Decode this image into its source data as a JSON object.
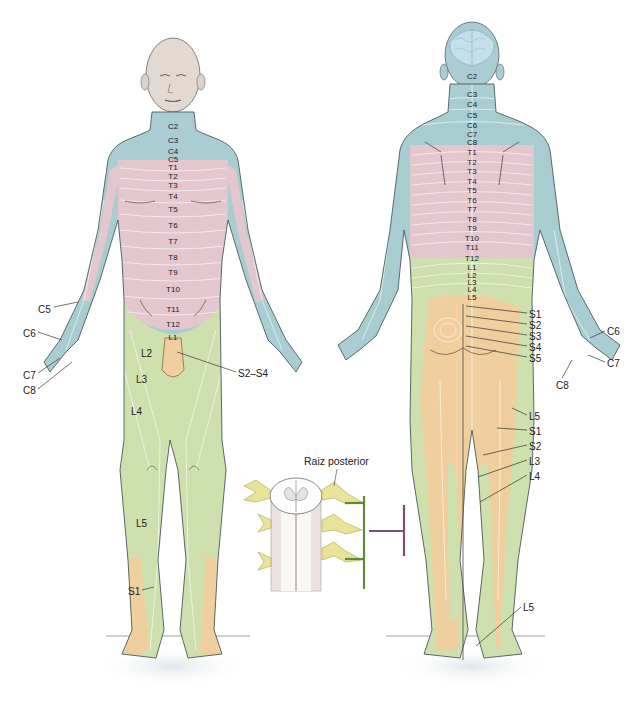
{
  "figure": {
    "colors": {
      "cervical": "#a9cdd2",
      "thoracic": "#e3c6ce",
      "lumbar": "#cfe0b0",
      "sacral": "#efcf9e",
      "skin": "#e6dfd8",
      "outline": "#4d5a5c",
      "nerve": "#e9e39a",
      "bracket_green": "#5e8a3a",
      "bracket_purple": "#7a4f73"
    }
  },
  "anterior": {
    "spine_labels": [
      {
        "text": "C2",
        "x": 173,
        "y": 123
      },
      {
        "text": "C3",
        "x": 173,
        "y": 137
      },
      {
        "text": "C4",
        "x": 173,
        "y": 148
      },
      {
        "text": "C5",
        "x": 173,
        "y": 156
      },
      {
        "text": "T1",
        "x": 173,
        "y": 164
      },
      {
        "text": "T2",
        "x": 173,
        "y": 173
      },
      {
        "text": "T3",
        "x": 173,
        "y": 182
      },
      {
        "text": "T4",
        "x": 173,
        "y": 193
      },
      {
        "text": "T5",
        "x": 173,
        "y": 206
      },
      {
        "text": "T6",
        "x": 173,
        "y": 222
      },
      {
        "text": "T7",
        "x": 173,
        "y": 238
      },
      {
        "text": "T8",
        "x": 173,
        "y": 254
      },
      {
        "text": "T9",
        "x": 173,
        "y": 269
      },
      {
        "text": "T10",
        "x": 173,
        "y": 286
      },
      {
        "text": "T11",
        "x": 173,
        "y": 306
      },
      {
        "text": "T12",
        "x": 173,
        "y": 321
      },
      {
        "text": "L1",
        "x": 173,
        "y": 334
      }
    ],
    "side_labels": [
      {
        "text": "C5",
        "x": 38,
        "y": 305
      },
      {
        "text": "C6",
        "x": 23,
        "y": 329
      },
      {
        "text": "C7",
        "x": 23,
        "y": 371
      },
      {
        "text": "C8",
        "x": 23,
        "y": 386
      },
      {
        "text": "L2",
        "x": 141,
        "y": 349
      },
      {
        "text": "L3",
        "x": 136,
        "y": 375
      },
      {
        "text": "L4",
        "x": 131,
        "y": 407
      },
      {
        "text": "L5",
        "x": 136,
        "y": 519
      },
      {
        "text": "S1",
        "x": 128,
        "y": 587
      },
      {
        "text": "S2–S4",
        "x": 238,
        "y": 369
      }
    ]
  },
  "posterior": {
    "spine_labels": [
      {
        "text": "C2",
        "x": 472,
        "y": 73
      },
      {
        "text": "C3",
        "x": 472,
        "y": 91
      },
      {
        "text": "C4",
        "x": 472,
        "y": 101
      },
      {
        "text": "C5",
        "x": 472,
        "y": 112
      },
      {
        "text": "C6",
        "x": 472,
        "y": 122
      },
      {
        "text": "C7",
        "x": 472,
        "y": 131
      },
      {
        "text": "C8",
        "x": 472,
        "y": 139
      },
      {
        "text": "T1",
        "x": 472,
        "y": 149
      },
      {
        "text": "T2",
        "x": 472,
        "y": 159
      },
      {
        "text": "T3",
        "x": 472,
        "y": 168
      },
      {
        "text": "T4",
        "x": 472,
        "y": 178
      },
      {
        "text": "T5",
        "x": 472,
        "y": 187
      },
      {
        "text": "T6",
        "x": 472,
        "y": 197
      },
      {
        "text": "T7",
        "x": 472,
        "y": 206
      },
      {
        "text": "T8",
        "x": 472,
        "y": 216
      },
      {
        "text": "T9",
        "x": 472,
        "y": 225
      },
      {
        "text": "T10",
        "x": 472,
        "y": 235
      },
      {
        "text": "T11",
        "x": 472,
        "y": 244
      },
      {
        "text": "T12",
        "x": 472,
        "y": 255
      },
      {
        "text": "L1",
        "x": 472,
        "y": 264
      },
      {
        "text": "L2",
        "x": 472,
        "y": 272
      },
      {
        "text": "L3",
        "x": 472,
        "y": 279
      },
      {
        "text": "L4",
        "x": 472,
        "y": 286
      },
      {
        "text": "L5",
        "x": 472,
        "y": 294
      }
    ],
    "side_labels": [
      {
        "text": "S1",
        "x": 529,
        "y": 310
      },
      {
        "text": "S2",
        "x": 529,
        "y": 321
      },
      {
        "text": "S3",
        "x": 529,
        "y": 332
      },
      {
        "text": "S4",
        "x": 529,
        "y": 343
      },
      {
        "text": "S5",
        "x": 529,
        "y": 354
      },
      {
        "text": "C6",
        "x": 607,
        "y": 327
      },
      {
        "text": "C7",
        "x": 607,
        "y": 359
      },
      {
        "text": "C8",
        "x": 556,
        "y": 381
      },
      {
        "text": "L5",
        "x": 529,
        "y": 412
      },
      {
        "text": "S1",
        "x": 529,
        "y": 427
      },
      {
        "text": "S2",
        "x": 529,
        "y": 442
      },
      {
        "text": "L3",
        "x": 529,
        "y": 457
      },
      {
        "text": "L4",
        "x": 529,
        "y": 472
      },
      {
        "text": "L5",
        "x": 523,
        "y": 603
      }
    ]
  },
  "inset": {
    "caption": "Raiz posterior"
  }
}
